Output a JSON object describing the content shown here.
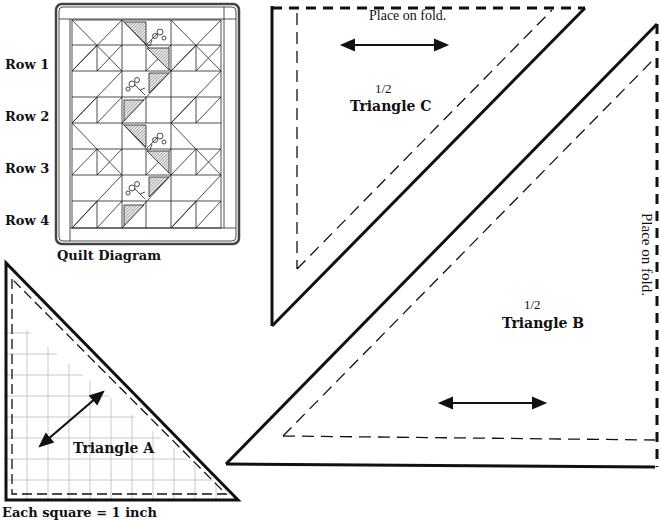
{
  "quilt_diagram": {
    "caption": "Quilt Diagram",
    "rows": [
      {
        "label": "Row 1"
      },
      {
        "label": "Row 2"
      },
      {
        "label": "Row 3"
      },
      {
        "label": "Row 4"
      }
    ]
  },
  "triangle_a": {
    "label": "Triangle A",
    "scale_note": "Each square = 1 inch"
  },
  "triangle_b": {
    "fraction": "1/2",
    "label": "Triangle B",
    "fold_note": "Place on fold."
  },
  "triangle_c": {
    "fraction": "1/2",
    "label": "Triangle C",
    "fold_note": "Place on fold."
  },
  "colors": {
    "line": "#111111",
    "grid": "#c8c8c8",
    "shade": "#bdbdbd",
    "background": "#ffffff"
  }
}
